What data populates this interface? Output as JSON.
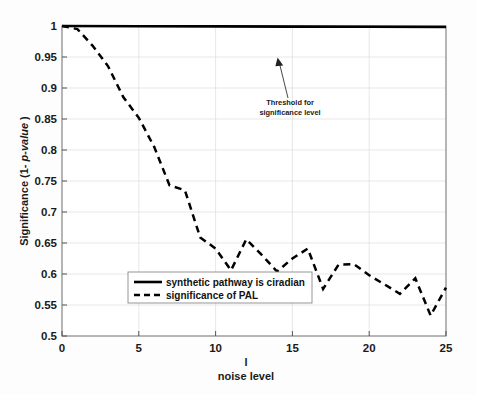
{
  "chart_data": {
    "type": "line",
    "title": "",
    "xlabel": "noise level",
    "xlabel_extra": "l",
    "ylabel_prefix": "Significance (1- ",
    "ylabel_italic": "p-value",
    "ylabel_suffix": " )",
    "xlim": [
      0,
      25
    ],
    "ylim": [
      0.5,
      1.0
    ],
    "xticks": [
      0,
      5,
      10,
      15,
      20,
      25
    ],
    "xticklabels": [
      "0",
      "5",
      "10",
      "15",
      "20",
      "25"
    ],
    "yticks": [
      0.5,
      0.55,
      0.6,
      0.65,
      0.7,
      0.75,
      0.8,
      0.85,
      0.9,
      0.95,
      1
    ],
    "yticklabels": [
      "0.5",
      "0.55",
      "0.6",
      "0.65",
      "0.7",
      "0.75",
      "0.8",
      "0.85",
      "0.9",
      "0.95",
      "1"
    ],
    "grid": true,
    "grid_color": "#d9d9d9",
    "legend_position": "lower center",
    "series": [
      {
        "name": "synthetic pathway is ciradian",
        "style": "solid",
        "color": "#000000",
        "x": [
          0,
          5,
          10,
          15,
          20,
          25
        ],
        "values": [
          1.0,
          0.9996,
          0.9993,
          0.999,
          0.9987,
          0.9984
        ]
      },
      {
        "name": "significance of PAL",
        "style": "dashed",
        "color": "#000000",
        "x": [
          0,
          1,
          2,
          3,
          4,
          5,
          6,
          7,
          8,
          9,
          10,
          11,
          12,
          13,
          14,
          15,
          16,
          17,
          18,
          19,
          20,
          21,
          22,
          23,
          24,
          25
        ],
        "values": [
          1.0,
          0.995,
          0.968,
          0.935,
          0.885,
          0.852,
          0.805,
          0.743,
          0.735,
          0.659,
          0.641,
          0.606,
          0.656,
          0.631,
          0.604,
          0.625,
          0.641,
          0.576,
          0.615,
          0.616,
          0.598,
          0.583,
          0.568,
          0.593,
          0.533,
          0.578
        ]
      }
    ],
    "annotations": [
      {
        "text_line1": "Threshold for",
        "text_line2": "significance level",
        "text_x": 12.9,
        "text_y": 0.872,
        "arrow_tip_x": 14.05,
        "arrow_tip_y": 0.947
      }
    ]
  }
}
